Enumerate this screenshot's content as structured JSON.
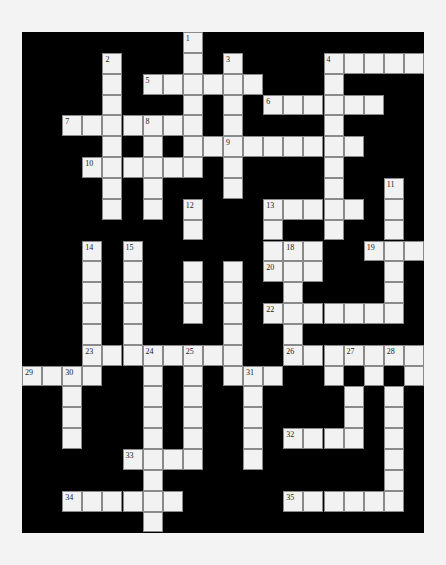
{
  "puzzle": {
    "type": "crossword",
    "cols": 20,
    "rows": 24,
    "colors": {
      "background": "#f3f3f3",
      "block": "#000000",
      "cell": "#f2f2f2",
      "cell_border": "#8a8a8a"
    },
    "grid": [
      "########.###########",
      "####.###.#.####.....",
      "####.#......###.####",
      "####.###.#.#......##",
      "##.......#.####.####",
      "####.#.#.........#",
      "###......#.####.####",
      "####.#.###.####.##.#",
      "####.#.#.###.....#.#",
      "########.###.##.##.#",
      "###.#.######...##...",
      "###.#.##.#.#...###.#",
      "###.#.##.#.##.####.#",
      "###.#.##.#.#.......#",
      "###.#.####.##.######",
      "###........##.......",
      "....##.#.#...##.#.#.",
      "##.###.#.##.####.#.#",
      "##.###.#.##.####.#.#",
      "##.###.#.##.#....#.#",
      "#####....##.######.#",
      "######.###########.#",
      "##......#####......#",
      "######.#############"
    ],
    "numbers": {
      "0,8": "1",
      "1,4": "2",
      "1,10": "3",
      "1,15": "4",
      "2,6": "5",
      "3,12": "6",
      "4,2": "7",
      "4,6": "8",
      "5,10": "9",
      "6,3": "10",
      "7,18": "11",
      "8,8": "12",
      "8,12": "13",
      "10,3": "14",
      "10,5": "15",
      "10,8": "16",
      "10,10": "17",
      "10,13": "18",
      "10,17": "19",
      "11,12": "20",
      "13,12": "22",
      "15,3": "23",
      "15,6": "24",
      "15,8": "25",
      "15,13": "26",
      "15,16": "27",
      "15,18": "28",
      "16,0": "29",
      "16,2": "30",
      "16,11": "31",
      "19,13": "32",
      "20,5": "33",
      "22,2": "34",
      "22,13": "35"
    },
    "entries": {
      "across": [
        {
          "num": "4",
          "row": 1,
          "col": 15,
          "length": 5
        },
        {
          "num": "5",
          "row": 2,
          "col": 6,
          "length": 6
        },
        {
          "num": "6",
          "row": 3,
          "col": 12,
          "length": 6
        },
        {
          "num": "7",
          "row": 4,
          "col": 2,
          "length": 7
        },
        {
          "num": "9",
          "row": 5,
          "col": 10,
          "length": 9
        },
        {
          "num": "10",
          "row": 6,
          "col": 3,
          "length": 6
        },
        {
          "num": "13",
          "row": 8,
          "col": 12,
          "length": 5
        },
        {
          "num": "16",
          "row": 10,
          "col": 8,
          "length": 6
        },
        {
          "num": "19",
          "row": 10,
          "col": 17,
          "length": 3
        },
        {
          "num": "20",
          "row": 11,
          "col": 12,
          "length": 3
        },
        {
          "num": "22",
          "row": 13,
          "col": 12,
          "length": 7
        },
        {
          "num": "23",
          "row": 15,
          "col": 3,
          "length": 8
        },
        {
          "num": "26",
          "row": 15,
          "col": 13,
          "length": 7
        },
        {
          "num": "29",
          "row": 16,
          "col": 0,
          "length": 4
        },
        {
          "num": "31",
          "row": 16,
          "col": 11,
          "length": 3
        },
        {
          "num": "32",
          "row": 19,
          "col": 13,
          "length": 4
        },
        {
          "num": "33",
          "row": 20,
          "col": 5,
          "length": 4
        },
        {
          "num": "34",
          "row": 22,
          "col": 2,
          "length": 6
        },
        {
          "num": "35",
          "row": 22,
          "col": 13,
          "length": 6
        }
      ],
      "down": [
        {
          "num": "1",
          "row": 0,
          "col": 8,
          "length": 5
        },
        {
          "num": "2",
          "row": 1,
          "col": 4,
          "length": 8
        },
        {
          "num": "3",
          "row": 1,
          "col": 10,
          "length": 7
        },
        {
          "num": "4",
          "row": 1,
          "col": 15,
          "length": 9
        },
        {
          "num": "8",
          "row": 4,
          "col": 6,
          "length": 5
        },
        {
          "num": "11",
          "row": 7,
          "col": 18,
          "length": 7
        },
        {
          "num": "12",
          "row": 8,
          "col": 8,
          "length": 6
        },
        {
          "num": "14",
          "row": 10,
          "col": 3,
          "length": 7
        },
        {
          "num": "15",
          "row": 10,
          "col": 5,
          "length": 6
        },
        {
          "num": "17",
          "row": 10,
          "col": 10,
          "length": 6
        },
        {
          "num": "18",
          "row": 10,
          "col": 13,
          "length": 7
        },
        {
          "num": "24",
          "row": 15,
          "col": 6,
          "length": 9
        },
        {
          "num": "25",
          "row": 15,
          "col": 8,
          "length": 6
        },
        {
          "num": "27",
          "row": 15,
          "col": 16,
          "length": 5
        },
        {
          "num": "28",
          "row": 15,
          "col": 18,
          "length": 8
        },
        {
          "num": "30",
          "row": 16,
          "col": 2,
          "length": 4
        },
        {
          "num": "31",
          "row": 16,
          "col": 11,
          "length": 5
        }
      ]
    }
  }
}
